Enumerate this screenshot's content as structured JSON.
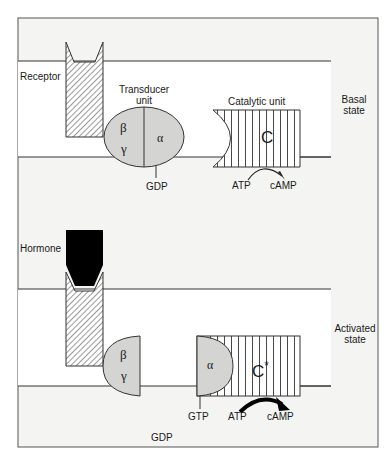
{
  "basal": {
    "receptor_label": "Receptor",
    "transducer_label_line1": "Transducer",
    "transducer_label_line2": "unit",
    "catalytic_label": "Catalytic unit",
    "state_line1": "Basal",
    "state_line2": "state",
    "beta": "β",
    "gamma": "γ",
    "alpha": "α",
    "catalytic_symbol": "C",
    "gdp": "GDP",
    "atp": "ATP",
    "camp": "cAMP"
  },
  "activated": {
    "hormone_label": "Hormone",
    "state_line1": "Activated",
    "state_line2": "state",
    "beta": "β",
    "gamma": "γ",
    "alpha": "α",
    "catalytic_symbol": "C",
    "catalytic_superscript": "*",
    "gtp": "GTP",
    "gdp": "GDP",
    "atp": "ATP",
    "camp": "cAMP"
  },
  "colors": {
    "frame_bg": "#f4f4f2",
    "membrane_bg": "#ffffff",
    "subunit_fill": "#d4d4d2",
    "line": "#333333",
    "hormone": "#000000"
  }
}
